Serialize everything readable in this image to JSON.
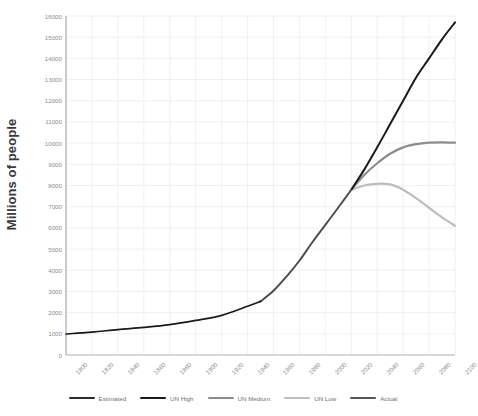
{
  "chart_data": {
    "type": "line",
    "title": "",
    "xlabel": "",
    "ylabel": "Millions of people",
    "xlim": [
      1800,
      2100
    ],
    "ylim": [
      0,
      16000
    ],
    "grid": true,
    "legend_position": "bottom",
    "x_ticks": [
      "1800",
      "1820",
      "1840",
      "1860",
      "1880",
      "1900",
      "1920",
      "1940",
      "1960",
      "1980",
      "2000",
      "2020",
      "2040",
      "2060",
      "2080",
      "2100"
    ],
    "y_ticks": [
      "0",
      "1000",
      "2000",
      "3000",
      "4000",
      "5000",
      "6000",
      "7000",
      "8000",
      "9000",
      "10000",
      "11000",
      "12000",
      "13000",
      "14000",
      "15000",
      "16000"
    ],
    "series": [
      {
        "name": "Estimated",
        "color": "#1a1a1a",
        "x": [
          1800,
          1820,
          1840,
          1860,
          1880,
          1900,
          1920,
          1940,
          1950
        ],
        "values": [
          990,
          1080,
          1200,
          1300,
          1430,
          1630,
          1870,
          2300,
          2530
        ]
      },
      {
        "name": "Actual",
        "color": "#4a4a4a",
        "x": [
          1950,
          1960,
          1970,
          1980,
          1990,
          2000,
          2010,
          2020
        ],
        "values": [
          2530,
          3030,
          3700,
          4450,
          5320,
          6140,
          6960,
          7800
        ]
      },
      {
        "name": "UN High",
        "color": "#1a1a1a",
        "x": [
          2020,
          2030,
          2040,
          2050,
          2060,
          2070,
          2080,
          2090,
          2100
        ],
        "values": [
          7800,
          8750,
          9800,
          10900,
          12000,
          13100,
          14000,
          14900,
          15700
        ]
      },
      {
        "name": "UN Medium",
        "color": "#8c8c8c",
        "x": [
          2020,
          2030,
          2040,
          2050,
          2060,
          2070,
          2080,
          2090,
          2100
        ],
        "values": [
          7800,
          8500,
          9050,
          9500,
          9800,
          9950,
          10020,
          10040,
          10020
        ]
      },
      {
        "name": "UN Low",
        "color": "#bdbdbd",
        "x": [
          2020,
          2030,
          2040,
          2050,
          2060,
          2070,
          2080,
          2090,
          2100
        ],
        "values": [
          7800,
          8000,
          8080,
          8050,
          7800,
          7400,
          6950,
          6500,
          6100
        ]
      }
    ]
  },
  "legend": {
    "items": [
      {
        "label": "Estimated",
        "color": "#2b2b2b"
      },
      {
        "label": "UN High",
        "color": "#1a1a1a"
      },
      {
        "label": "UN Medium",
        "color": "#8c8c8c"
      },
      {
        "label": "UN Low",
        "color": "#bdbdbd"
      },
      {
        "label": "Actual",
        "color": "#555555"
      }
    ]
  },
  "axes": {
    "y_title": "Millions of people"
  },
  "colors": {
    "grid": "#ececec",
    "axis": "#b8b8b8",
    "tick_text": "#8d8d8d",
    "title_text": "#3a3a3a",
    "background": "#ffffff"
  }
}
